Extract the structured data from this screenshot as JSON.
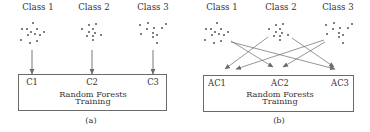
{
  "figure": {
    "panels": [
      {
        "caption": "(a)",
        "classes": [
          {
            "label": "Class 1",
            "x": 38
          },
          {
            "label": "Class 2",
            "x": 94
          },
          {
            "label": "Class 3",
            "x": 153
          }
        ],
        "box": {
          "title_line1": "Random Forests",
          "title_line2": "Training"
        },
        "inputs": [
          {
            "label": "C1",
            "x": 32
          },
          {
            "label": "C2",
            "x": 92
          },
          {
            "label": "C3",
            "x": 153
          }
        ]
      },
      {
        "caption": "(b)",
        "classes": [
          {
            "label": "Class 1",
            "x": 222
          },
          {
            "label": "Class 2",
            "x": 281
          },
          {
            "label": "Class 3",
            "x": 338
          }
        ],
        "box": {
          "title_line1": "Random Forests",
          "title_line2": "Training"
        },
        "inputs": [
          {
            "label": "AC1",
            "x": 217
          },
          {
            "label": "AC2",
            "x": 280
          },
          {
            "label": "AC3",
            "x": 340
          }
        ]
      }
    ],
    "colors": {
      "line": "#6a6a6a",
      "dot": "#555555",
      "text": "#333333"
    }
  }
}
